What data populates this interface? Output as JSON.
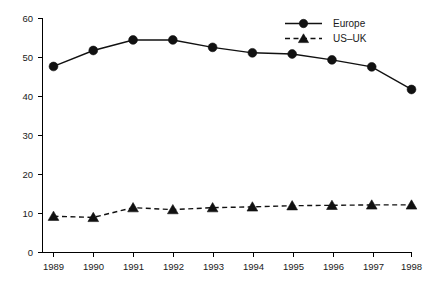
{
  "chart_data": {
    "type": "line",
    "title": "",
    "subtitle": "",
    "xlabel": "",
    "ylabel": "",
    "categories": [
      "1989",
      "1990",
      "1991",
      "1992",
      "1993",
      "1994",
      "1995",
      "1996",
      "1997",
      "1998"
    ],
    "x": [
      1989,
      1990,
      1991,
      1992,
      1993,
      1994,
      1995,
      1996,
      1997,
      1998
    ],
    "series": [
      {
        "name": "Europe",
        "marker": "circle",
        "linestyle": "solid",
        "color": "#111111",
        "values": [
          47.7,
          51.8,
          54.5,
          54.5,
          52.6,
          51.2,
          50.9,
          49.4,
          47.6,
          41.8
        ]
      },
      {
        "name": "US–UK",
        "marker": "triangle",
        "linestyle": "dashed",
        "color": "#111111",
        "values": [
          9.3,
          9.0,
          11.5,
          11.0,
          11.5,
          11.7,
          12.0,
          12.1,
          12.2,
          12.2
        ]
      }
    ],
    "xlim": [
      1988.5,
      1998.5
    ],
    "ylim": [
      0,
      60
    ],
    "yticks": [
      0,
      10,
      20,
      30,
      40,
      50,
      60
    ],
    "ytick_labels": [
      "0",
      "10",
      "20",
      "30",
      "40",
      "50",
      "60"
    ],
    "xtick_labels": [
      "1989",
      "1990",
      "1991",
      "1992",
      "1993",
      "1994",
      "1995",
      "1996",
      "1997",
      "1998"
    ],
    "grid": false,
    "legend_position": "top-right",
    "legend_entries": [
      {
        "label": "Europe",
        "marker": "circle",
        "linestyle": "solid"
      },
      {
        "label": "US–UK",
        "marker": "triangle",
        "linestyle": "dashed"
      }
    ]
  },
  "axes": {
    "y_tick_0": "0",
    "y_tick_1": "10",
    "y_tick_2": "20",
    "y_tick_3": "30",
    "y_tick_4": "40",
    "y_tick_5": "50",
    "y_tick_6": "60",
    "x_tick_0": "1989",
    "x_tick_1": "1990",
    "x_tick_2": "1991",
    "x_tick_3": "1992",
    "x_tick_4": "1993",
    "x_tick_5": "1994",
    "x_tick_6": "1995",
    "x_tick_7": "1996",
    "x_tick_8": "1997",
    "x_tick_9": "1998"
  },
  "legend": {
    "europe_label": "Europe",
    "usuk_label": "US–UK"
  },
  "colors": {
    "ink": "#111111",
    "background": "#ffffff"
  }
}
